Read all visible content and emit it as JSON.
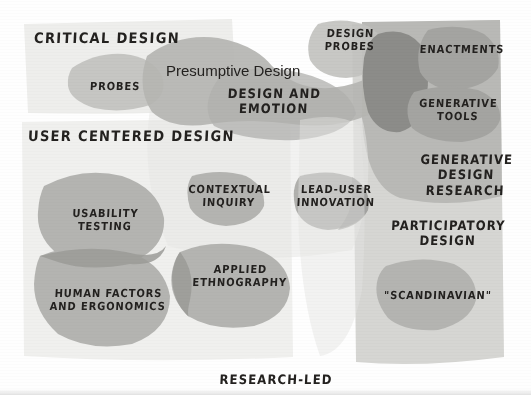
{
  "figure": {
    "type": "venn-landscape-diagram",
    "bottom_axis_label": "RESEARCH-LED",
    "background_color": "#fefefe"
  },
  "panels": [
    {
      "id": "critical-design",
      "label": "CRITICAL DESIGN",
      "color": "#eeeeec"
    },
    {
      "id": "user-centered-design",
      "label": "USER CENTERED DESIGN",
      "color": "#f0f0ee"
    },
    {
      "id": "generative-design-research",
      "label": "GENERATIVE\nDESIGN\nRESEARCH",
      "color": "#b9b9b6"
    },
    {
      "id": "participatory-design",
      "label": "PARTICIPATORY\nDESIGN",
      "color": "#d6d6d3"
    }
  ],
  "blobs": [
    {
      "id": "probes",
      "label": "PROBES",
      "color": "#c6c6c3"
    },
    {
      "id": "design-probes",
      "label": "DESIGN\nPROBES",
      "color": "#c2c2bf"
    },
    {
      "id": "presumptive-design",
      "label": "Presumptive Design",
      "color": "#b5b5b2",
      "font": "plain"
    },
    {
      "id": "design-and-emotion",
      "label": "DESIGN AND\nEMOTION",
      "color": "#b0b0ad"
    },
    {
      "id": "enactments",
      "label": "ENACTMENTS",
      "color": "#a4a4a1"
    },
    {
      "id": "generative-tools",
      "label": "GENERATIVE\nTOOLS",
      "color": "#a4a4a1"
    },
    {
      "id": "usability-testing",
      "label": "USABILITY\nTESTING",
      "color": "#b4b4b1"
    },
    {
      "id": "human-factors-ergonomics",
      "label": "HUMAN FACTORS\nAND ERGONOMICS",
      "color": "#b4b4b1"
    },
    {
      "id": "contextual-inquiry",
      "label": "CONTEXTUAL\nINQUIRY",
      "color": "#b4b4b1"
    },
    {
      "id": "applied-ethnography",
      "label": "APPLIED\nETHNOGRAPHY",
      "color": "#b4b4b1"
    },
    {
      "id": "lead-user-innovation",
      "label": "LEAD-USER\nINNOVATION",
      "color": "#b0b0ad"
    },
    {
      "id": "scandinavian",
      "label": "\"SCANDINAVIAN\"",
      "color": "#b4b4b1"
    },
    {
      "id": "dark-overlap",
      "label": "",
      "color": "#8c8c89"
    }
  ]
}
